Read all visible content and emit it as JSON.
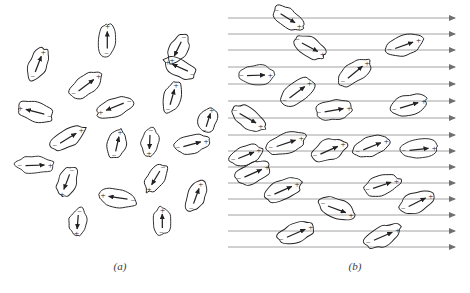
{
  "figure": {
    "width": 470,
    "height": 293,
    "background": "#ffffff",
    "ink_color": "#222222",
    "field_line_color": "#8a8a8a",
    "sign_positive": "+",
    "sign_negative": "−"
  },
  "panels": [
    {
      "id": "a",
      "caption": "(a)",
      "caption_x": 105,
      "caption_y": 260,
      "description": "randomly oriented dipoles, no external field",
      "field_lines": [],
      "dipoles": [
        {
          "cx": 38,
          "cy": 64,
          "rx": 17,
          "ry": 9,
          "angle": -67
        },
        {
          "cx": 107,
          "cy": 40,
          "rx": 17,
          "ry": 9,
          "angle": -88
        },
        {
          "cx": 180,
          "cy": 68,
          "rx": 17,
          "ry": 9,
          "angle": 206
        },
        {
          "cx": 178,
          "cy": 49,
          "rx": 16,
          "ry": 9,
          "angle": 118
        },
        {
          "cx": 86,
          "cy": 85,
          "rx": 19,
          "ry": 10,
          "angle": -35
        },
        {
          "cx": 172,
          "cy": 97,
          "rx": 16,
          "ry": 9,
          "angle": -72
        },
        {
          "cx": 115,
          "cy": 107,
          "rx": 19,
          "ry": 9,
          "angle": 160
        },
        {
          "cx": 35,
          "cy": 112,
          "rx": 19,
          "ry": 10,
          "angle": 196
        },
        {
          "cx": 68,
          "cy": 138,
          "rx": 19,
          "ry": 9,
          "angle": -30
        },
        {
          "cx": 117,
          "cy": 144,
          "rx": 15,
          "ry": 9,
          "angle": -75
        },
        {
          "cx": 150,
          "cy": 142,
          "rx": 14,
          "ry": 9,
          "angle": 95
        },
        {
          "cx": 192,
          "cy": 144,
          "rx": 18,
          "ry": 9,
          "angle": -13
        },
        {
          "cx": 35,
          "cy": 165,
          "rx": 19,
          "ry": 9,
          "angle": 0
        },
        {
          "cx": 67,
          "cy": 182,
          "rx": 16,
          "ry": 9,
          "angle": 113
        },
        {
          "cx": 156,
          "cy": 178,
          "rx": 16,
          "ry": 9,
          "angle": 123
        },
        {
          "cx": 196,
          "cy": 196,
          "rx": 16,
          "ry": 9,
          "angle": -68
        },
        {
          "cx": 118,
          "cy": 198,
          "rx": 19,
          "ry": 9,
          "angle": 190
        },
        {
          "cx": 78,
          "cy": 222,
          "rx": 14,
          "ry": 9,
          "angle": 97
        },
        {
          "cx": 162,
          "cy": 221,
          "rx": 14,
          "ry": 9,
          "angle": -88
        },
        {
          "cx": 208,
          "cy": 120,
          "rx": 14,
          "ry": 9,
          "angle": -70
        }
      ]
    },
    {
      "id": "b",
      "caption": "(b)",
      "caption_x": 340,
      "caption_y": 260,
      "description": "dipoles aligned with applied electric field",
      "field_lines": {
        "count": 15,
        "x_start": 228,
        "x_end": 455,
        "y_values": [
          18,
          34,
          50,
          67,
          84,
          101,
          118,
          135,
          151,
          167,
          183,
          199,
          215,
          231,
          247
        ],
        "arrow_direction": "right"
      },
      "dipoles": [
        {
          "cx": 310,
          "cy": 47,
          "rx": 18,
          "ry": 10,
          "angle": 30
        },
        {
          "cx": 404,
          "cy": 45,
          "rx": 19,
          "ry": 10,
          "angle": -18
        },
        {
          "cx": 256,
          "cy": 75,
          "rx": 18,
          "ry": 10,
          "angle": 0
        },
        {
          "cx": 355,
          "cy": 72,
          "rx": 19,
          "ry": 10,
          "angle": -38
        },
        {
          "cx": 297,
          "cy": 92,
          "rx": 19,
          "ry": 10,
          "angle": -35
        },
        {
          "cx": 334,
          "cy": 110,
          "rx": 19,
          "ry": 10,
          "angle": -8
        },
        {
          "cx": 409,
          "cy": 105,
          "rx": 19,
          "ry": 10,
          "angle": -15
        },
        {
          "cx": 248,
          "cy": 118,
          "rx": 19,
          "ry": 10,
          "angle": 32
        },
        {
          "cx": 286,
          "cy": 143,
          "rx": 20,
          "ry": 10,
          "angle": -17
        },
        {
          "cx": 329,
          "cy": 150,
          "rx": 19,
          "ry": 10,
          "angle": -22
        },
        {
          "cx": 372,
          "cy": 146,
          "rx": 19,
          "ry": 10,
          "angle": -20
        },
        {
          "cx": 419,
          "cy": 149,
          "rx": 19,
          "ry": 10,
          "angle": -4
        },
        {
          "cx": 253,
          "cy": 173,
          "rx": 19,
          "ry": 10,
          "angle": -22
        },
        {
          "cx": 283,
          "cy": 190,
          "rx": 19,
          "ry": 10,
          "angle": -22
        },
        {
          "cx": 382,
          "cy": 185,
          "rx": 19,
          "ry": 10,
          "angle": -17
        },
        {
          "cx": 337,
          "cy": 209,
          "rx": 19,
          "ry": 10,
          "angle": 22
        },
        {
          "cx": 417,
          "cy": 202,
          "rx": 19,
          "ry": 10,
          "angle": -25
        },
        {
          "cx": 296,
          "cy": 233,
          "rx": 20,
          "ry": 10,
          "angle": -22
        },
        {
          "cx": 383,
          "cy": 236,
          "rx": 20,
          "ry": 10,
          "angle": -22
        },
        {
          "cx": 288,
          "cy": 18,
          "rx": 17,
          "ry": 9,
          "angle": 34
        },
        {
          "cx": 246,
          "cy": 155,
          "rx": 17,
          "ry": 9,
          "angle": -20
        }
      ]
    }
  ]
}
